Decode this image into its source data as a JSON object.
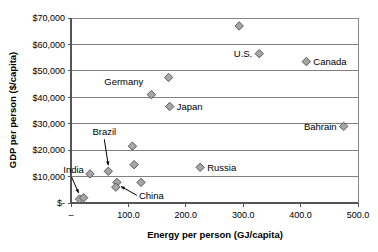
{
  "chart_data": {
    "type": "scatter",
    "title": "",
    "xlabel": "Energy per person (GJ/capita)",
    "ylabel": "GDP per person ($/capita)",
    "xlim": [
      0,
      500
    ],
    "ylim": [
      0,
      70000
    ],
    "grid": true,
    "legend": "none",
    "xticks": [
      {
        "value": 0,
        "label": "–"
      },
      {
        "value": 100,
        "label": "100.0"
      },
      {
        "value": 200,
        "label": "200.0"
      },
      {
        "value": 300,
        "label": "300.0"
      },
      {
        "value": 400,
        "label": "400.0"
      },
      {
        "value": 500,
        "label": "500.0"
      }
    ],
    "yticks": [
      {
        "value": 0,
        "label": "$-"
      },
      {
        "value": 10000,
        "label": "$10,000"
      },
      {
        "value": 20000,
        "label": "$20,000"
      },
      {
        "value": 30000,
        "label": "$30,000"
      },
      {
        "value": 40000,
        "label": "$40,000"
      },
      {
        "value": 50000,
        "label": "$50,000"
      },
      {
        "value": 60000,
        "label": "$60,000"
      },
      {
        "value": 70000,
        "label": "$70,000"
      }
    ],
    "points": [
      {
        "name": "",
        "x": 293,
        "y": 67000
      },
      {
        "name": "U.S.",
        "x": 328,
        "y": 56500
      },
      {
        "name": "Canada",
        "x": 410,
        "y": 53500
      },
      {
        "name": "",
        "x": 170,
        "y": 47500
      },
      {
        "name": "Germany",
        "x": 140,
        "y": 41000
      },
      {
        "name": "Japan",
        "x": 172,
        "y": 36500
      },
      {
        "name": "Bahrain",
        "x": 475,
        "y": 29000
      },
      {
        "name": "",
        "x": 107,
        "y": 21500
      },
      {
        "name": "",
        "x": 110,
        "y": 14500
      },
      {
        "name": "Russia",
        "x": 225,
        "y": 13500
      },
      {
        "name": "Brazil",
        "x": 65,
        "y": 12000
      },
      {
        "name": "",
        "x": 33,
        "y": 11000
      },
      {
        "name": "",
        "x": 122,
        "y": 7800
      },
      {
        "name": "China",
        "x": 80,
        "y": 7800
      },
      {
        "name": "",
        "x": 78,
        "y": 6000
      },
      {
        "name": "India",
        "x": 15,
        "y": 1500
      },
      {
        "name": "",
        "x": 22,
        "y": 2000
      }
    ],
    "annotations": [
      {
        "text": "U.S.",
        "x": 328,
        "y": 56500,
        "placement": "left"
      },
      {
        "text": "Canada",
        "x": 410,
        "y": 53500,
        "placement": "right"
      },
      {
        "text": "Germany",
        "x": 140,
        "y": 41000,
        "placement": "above-left"
      },
      {
        "text": "Japan",
        "x": 172,
        "y": 36500,
        "placement": "right"
      },
      {
        "text": "Bahrain",
        "x": 475,
        "y": 29000,
        "placement": "left"
      },
      {
        "text": "Russia",
        "x": 225,
        "y": 13500,
        "placement": "right"
      },
      {
        "text": "Brazil",
        "x": 65,
        "y": 12000,
        "placement": "arrow-above"
      },
      {
        "text": "India",
        "x": 15,
        "y": 1500,
        "placement": "arrow-above"
      },
      {
        "text": "China",
        "x": 80,
        "y": 7800,
        "placement": "arrow-below-right"
      }
    ],
    "marker": {
      "shape": "diamond",
      "fill": "#a6a6a6",
      "stroke": "#4d4d4d"
    },
    "colors": {
      "background": "#ffffff",
      "gridline": "#808080",
      "axis": "#555555",
      "text": "#000000"
    }
  }
}
